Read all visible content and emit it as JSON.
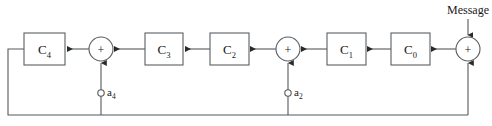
{
  "diagram": {
    "input_label": "Message",
    "operator_symbol": "+",
    "colors": {
      "wire": "#555a5e",
      "outline": "#5a6064",
      "text": "#1a1a1a",
      "background": "#ffffff"
    },
    "blocks": [
      {
        "id": "C4",
        "base": "C",
        "subscript": "4",
        "x": 24,
        "y": 33,
        "w": 41,
        "h": 32
      },
      {
        "id": "C3",
        "base": "C",
        "subscript": "3",
        "x": 145,
        "y": 33,
        "w": 38,
        "h": 32
      },
      {
        "id": "C2",
        "base": "C",
        "subscript": "2",
        "x": 210,
        "y": 33,
        "w": 39,
        "h": 32
      },
      {
        "id": "C1",
        "base": "C",
        "subscript": "1",
        "x": 327,
        "y": 33,
        "w": 39,
        "h": 32
      },
      {
        "id": "C0",
        "base": "C",
        "subscript": "0",
        "x": 391,
        "y": 33,
        "w": 39,
        "h": 32
      }
    ],
    "adders": [
      {
        "id": "adder-a4",
        "cx": 101,
        "cy": 49,
        "r": 12
      },
      {
        "id": "adder-a2",
        "cx": 288,
        "cy": 49,
        "r": 12
      },
      {
        "id": "adder-message",
        "cx": 468,
        "cy": 49,
        "r": 12
      }
    ],
    "taps": [
      {
        "id": "a4",
        "base": "a",
        "subscript": "4",
        "cx": 101,
        "cy": 93,
        "r": 3.2,
        "label_x": 107,
        "label_y": 96
      },
      {
        "id": "a2",
        "base": "a",
        "subscript": "2",
        "cx": 288,
        "cy": 93,
        "r": 3.2,
        "label_x": 294,
        "label_y": 96
      }
    ],
    "message": {
      "text": "Message",
      "x": 443,
      "y": 14,
      "arrow_x": 468,
      "arrow_from_y": 19,
      "arrow_to_y": 34
    },
    "feedback_bus": {
      "y": 115,
      "x_left": 8,
      "x_right": 468
    }
  }
}
